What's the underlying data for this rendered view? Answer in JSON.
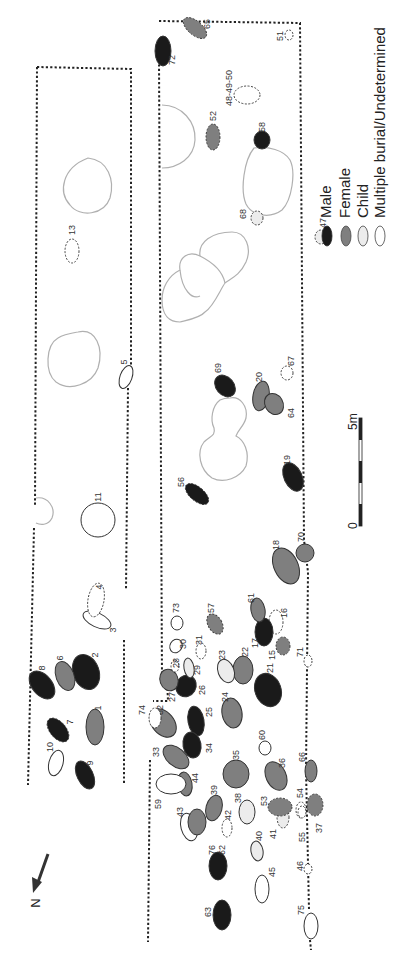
{
  "colors": {
    "male": "#1a1a1a",
    "female": "#7f7f7f",
    "child": "#ececec",
    "undetermined": "#ffffff",
    "stroke": "#333333",
    "pit_outline": "#b0b0b0",
    "trench_border": "#222222"
  },
  "legend": {
    "items": [
      {
        "key": "male",
        "label": "Male"
      },
      {
        "key": "female",
        "label": "Female"
      },
      {
        "key": "child",
        "label": "Child"
      },
      {
        "key": "undetermined",
        "label": "Multiple burial/Undetermined"
      }
    ]
  },
  "scale_bar": {
    "start_label": "0",
    "end_label": "5m"
  },
  "north_arrow": {
    "label": "N"
  },
  "burials": [
    {
      "id": "1",
      "label": "1",
      "category": "female",
      "cx": 95,
      "cy": 727,
      "rx": 9,
      "ry": 18,
      "rot": 0,
      "dashed": false,
      "lx": 98,
      "ly": 708
    },
    {
      "id": "2",
      "label": "2",
      "category": "male",
      "cx": 86,
      "cy": 672,
      "rx": 13,
      "ry": 18,
      "rot": -20,
      "dashed": false,
      "lx": 95,
      "ly": 655
    },
    {
      "id": "3",
      "label": "3",
      "category": "undetermined",
      "cx": 97,
      "cy": 620,
      "rx": 15,
      "ry": 7,
      "rot": 25,
      "dashed": false,
      "lx": 113,
      "ly": 630
    },
    {
      "id": "4",
      "label": "4",
      "category": "undetermined",
      "cx": 96,
      "cy": 600,
      "rx": 8,
      "ry": 17,
      "rot": 10,
      "dashed": true,
      "lx": 99,
      "ly": 587
    },
    {
      "id": "5",
      "label": "5",
      "category": "undetermined",
      "cx": 126,
      "cy": 377,
      "rx": 6,
      "ry": 12,
      "rot": 20,
      "dashed": false,
      "lx": 124,
      "ly": 362
    },
    {
      "id": "6",
      "label": "6",
      "category": "female",
      "cx": 65,
      "cy": 676,
      "rx": 9,
      "ry": 15,
      "rot": -20,
      "dashed": false,
      "lx": 60,
      "ly": 658
    },
    {
      "id": "7",
      "label": "7",
      "category": "male",
      "cx": 58,
      "cy": 730,
      "rx": 8,
      "ry": 14,
      "rot": -40,
      "dashed": true,
      "lx": 70,
      "ly": 722
    },
    {
      "id": "8",
      "label": "8",
      "category": "male",
      "cx": 42,
      "cy": 685,
      "rx": 10,
      "ry": 16,
      "rot": -40,
      "dashed": false,
      "lx": 42,
      "ly": 668
    },
    {
      "id": "9",
      "label": "9",
      "category": "male",
      "cx": 85,
      "cy": 775,
      "rx": 8,
      "ry": 15,
      "rot": -25,
      "dashed": false,
      "lx": 90,
      "ly": 763
    },
    {
      "id": "10",
      "label": "10",
      "category": "undetermined",
      "cx": 56,
      "cy": 763,
      "rx": 7,
      "ry": 13,
      "rot": 15,
      "dashed": false,
      "lx": 50,
      "ly": 747
    },
    {
      "id": "11",
      "label": "11",
      "category": "undetermined",
      "cx": 98,
      "cy": 520,
      "rx": 17,
      "ry": 17,
      "rot": 0,
      "dashed": false,
      "lx": 98,
      "ly": 497
    },
    {
      "id": "13",
      "label": "13",
      "category": "undetermined",
      "cx": 72,
      "cy": 251,
      "rx": 7,
      "ry": 12,
      "rot": 0,
      "dashed": true,
      "lx": 72,
      "ly": 230
    },
    {
      "id": "15",
      "label": "15",
      "category": "female",
      "cx": 283,
      "cy": 646,
      "rx": 7,
      "ry": 9,
      "rot": 0,
      "dashed": true,
      "lx": 272,
      "ly": 655
    },
    {
      "id": "16",
      "label": "16",
      "category": "undetermined",
      "cx": 276,
      "cy": 622,
      "rx": 7,
      "ry": 12,
      "rot": 0,
      "dashed": true,
      "lx": 284,
      "ly": 613
    },
    {
      "id": "17",
      "label": "17",
      "category": "male",
      "cx": 264,
      "cy": 632,
      "rx": 9,
      "ry": 14,
      "rot": 0,
      "dashed": false,
      "lx": 255,
      "ly": 643
    },
    {
      "id": "18",
      "label": "18",
      "category": "female",
      "cx": 286,
      "cy": 566,
      "rx": 12,
      "ry": 19,
      "rot": -25,
      "dashed": false,
      "lx": 276,
      "ly": 545
    },
    {
      "id": "19",
      "label": "19",
      "category": "male",
      "cx": 293,
      "cy": 477,
      "rx": 9,
      "ry": 15,
      "rot": -25,
      "dashed": false,
      "lx": 287,
      "ly": 460
    },
    {
      "id": "20",
      "label": "20",
      "category": "female",
      "cx": 261,
      "cy": 396,
      "rx": 8,
      "ry": 15,
      "rot": 10,
      "dashed": false,
      "lx": 259,
      "ly": 377
    },
    {
      "id": "21",
      "label": "21",
      "category": "male",
      "cx": 268,
      "cy": 690,
      "rx": 13,
      "ry": 17,
      "rot": -20,
      "dashed": false,
      "lx": 270,
      "ly": 668
    },
    {
      "id": "22",
      "label": "22",
      "category": "female",
      "cx": 243,
      "cy": 670,
      "rx": 10,
      "ry": 14,
      "rot": 0,
      "dashed": false,
      "lx": 245,
      "ly": 652
    },
    {
      "id": "23",
      "label": "23",
      "category": "child",
      "cx": 226,
      "cy": 671,
      "rx": 8,
      "ry": 12,
      "rot": -20,
      "dashed": false,
      "lx": 222,
      "ly": 655
    },
    {
      "id": "24",
      "label": "24",
      "category": "female",
      "cx": 232,
      "cy": 713,
      "rx": 10,
      "ry": 15,
      "rot": -10,
      "dashed": false,
      "lx": 225,
      "ly": 697
    },
    {
      "id": "25",
      "label": "25",
      "category": "male",
      "cx": 196,
      "cy": 721,
      "rx": 8,
      "ry": 15,
      "rot": -10,
      "dashed": false,
      "lx": 209,
      "ly": 712
    },
    {
      "id": "26",
      "label": "26",
      "category": "male",
      "cx": 186,
      "cy": 686,
      "rx": 10,
      "ry": 11,
      "rot": 30,
      "dashed": false,
      "lx": 202,
      "ly": 690
    },
    {
      "id": "27",
      "label": "27",
      "category": "female",
      "cx": 169,
      "cy": 680,
      "rx": 9,
      "ry": 11,
      "rot": -20,
      "dashed": false,
      "lx": 172,
      "ly": 697
    },
    {
      "id": "28",
      "label": "28",
      "category": "undetermined",
      "cx": 175,
      "cy": 666,
      "rx": 4,
      "ry": 6,
      "rot": 0,
      "dashed": true,
      "lx": 176,
      "ly": 663
    },
    {
      "id": "29",
      "label": "29",
      "category": "child",
      "cx": 189,
      "cy": 668,
      "rx": 5,
      "ry": 10,
      "rot": -10,
      "dashed": false,
      "lx": 197,
      "ly": 670
    },
    {
      "id": "30",
      "label": "30",
      "category": "undetermined",
      "cx": 176,
      "cy": 646,
      "rx": 6,
      "ry": 7,
      "rot": 30,
      "dashed": false,
      "lx": 183,
      "ly": 644
    },
    {
      "id": "31",
      "label": "31",
      "category": "undetermined",
      "cx": 201,
      "cy": 651,
      "rx": 5,
      "ry": 8,
      "rot": 0,
      "dashed": true,
      "lx": 199,
      "ly": 640
    },
    {
      "id": "32",
      "label": "32",
      "category": "female",
      "cx": 163,
      "cy": 723,
      "rx": 11,
      "ry": 16,
      "rot": -40,
      "dashed": false,
      "lx": 160,
      "ly": 710
    },
    {
      "id": "33",
      "label": "33",
      "category": "female",
      "cx": 176,
      "cy": 757,
      "rx": 9,
      "ry": 15,
      "rot": -50,
      "dashed": false,
      "lx": 156,
      "ly": 752
    },
    {
      "id": "34",
      "label": "34",
      "category": "male",
      "cx": 192,
      "cy": 745,
      "rx": 9,
      "ry": 13,
      "rot": -10,
      "dashed": false,
      "lx": 209,
      "ly": 748
    },
    {
      "id": "35",
      "label": "35",
      "category": "female",
      "cx": 236,
      "cy": 774,
      "rx": 13,
      "ry": 14,
      "rot": 0,
      "dashed": false,
      "lx": 236,
      "ly": 755
    },
    {
      "id": "36",
      "label": "36",
      "category": "female",
      "cx": 276,
      "cy": 776,
      "rx": 10,
      "ry": 15,
      "rot": -25,
      "dashed": false,
      "lx": 282,
      "ly": 763
    },
    {
      "id": "37",
      "label": "37",
      "category": "female",
      "cx": 315,
      "cy": 805,
      "rx": 8,
      "ry": 11,
      "rot": 0,
      "dashed": true,
      "lx": 319,
      "ly": 828
    },
    {
      "id": "38",
      "label": "38",
      "category": "child",
      "cx": 247,
      "cy": 812,
      "rx": 8,
      "ry": 12,
      "rot": 0,
      "dashed": false,
      "lx": 238,
      "ly": 798
    },
    {
      "id": "39",
      "label": "39",
      "category": "female",
      "cx": 214,
      "cy": 808,
      "rx": 8,
      "ry": 13,
      "rot": 15,
      "dashed": false,
      "lx": 214,
      "ly": 790
    },
    {
      "id": "40",
      "label": "40",
      "category": "child",
      "cx": 257,
      "cy": 851,
      "rx": 6,
      "ry": 10,
      "rot": -10,
      "dashed": false,
      "lx": 259,
      "ly": 836
    },
    {
      "id": "41",
      "label": "41",
      "category": "child",
      "cx": 283,
      "cy": 817,
      "rx": 6,
      "ry": 11,
      "rot": 0,
      "dashed": true,
      "lx": 273,
      "ly": 834
    },
    {
      "id": "42",
      "label": "42",
      "category": "undetermined",
      "cx": 227,
      "cy": 828,
      "rx": 5,
      "ry": 9,
      "rot": 0,
      "dashed": true,
      "lx": 228,
      "ly": 815
    },
    {
      "id": "43",
      "label": "43",
      "category": "undetermined",
      "cx": 189,
      "cy": 827,
      "rx": 8,
      "ry": 14,
      "rot": -15,
      "dashed": false,
      "lx": 180,
      "ly": 812
    },
    {
      "id": "44",
      "label": "44",
      "category": "female",
      "cx": 185,
      "cy": 784,
      "rx": 7,
      "ry": 12,
      "rot": -10,
      "dashed": false,
      "lx": 195,
      "ly": 778
    },
    {
      "id": "45",
      "label": "45",
      "category": "undetermined",
      "cx": 262,
      "cy": 889,
      "rx": 7,
      "ry": 14,
      "rot": 0,
      "dashed": false,
      "lx": 272,
      "ly": 872
    },
    {
      "id": "46",
      "label": "46",
      "category": "undetermined",
      "cx": 308,
      "cy": 869,
      "rx": 4,
      "ry": 5,
      "rot": 0,
      "dashed": true,
      "lx": 300,
      "ly": 866
    },
    {
      "id": "47",
      "label": "47",
      "category": "child",
      "cx": 321,
      "cy": 237,
      "rx": 6,
      "ry": 7,
      "rot": 0,
      "dashed": true,
      "lx": 323,
      "ly": 223
    },
    {
      "id": "48-49-50",
      "label": "48-49-50",
      "category": "undetermined",
      "cx": 247,
      "cy": 95,
      "rx": 13,
      "ry": 9,
      "rot": 0,
      "dashed": true,
      "lx": 229,
      "ly": 88
    },
    {
      "id": "51",
      "label": "51",
      "category": "undetermined",
      "cx": 289,
      "cy": 35,
      "rx": 4,
      "ry": 5,
      "rot": 0,
      "dashed": true,
      "lx": 280,
      "ly": 36
    },
    {
      "id": "52",
      "label": "52",
      "category": "female",
      "cx": 213,
      "cy": 137,
      "rx": 7,
      "ry": 13,
      "rot": 0,
      "dashed": true,
      "lx": 213,
      "ly": 116
    },
    {
      "id": "53",
      "label": "53",
      "category": "female",
      "cx": 280,
      "cy": 807,
      "rx": 12,
      "ry": 9,
      "rot": 0,
      "dashed": true,
      "lx": 264,
      "ly": 801
    },
    {
      "id": "54",
      "label": "54",
      "category": "undetermined",
      "cx": 301,
      "cy": 810,
      "rx": 5,
      "ry": 8,
      "rot": 0,
      "dashed": true,
      "lx": 300,
      "ly": 793
    },
    {
      "id": "55",
      "label": "55",
      "category": "undetermined",
      "cx": 302,
      "cy": 812,
      "rx": 4,
      "ry": 6,
      "rot": 0,
      "dashed": true,
      "lx": 302,
      "ly": 837
    },
    {
      "id": "56",
      "label": "56",
      "category": "male",
      "cx": 197,
      "cy": 494,
      "rx": 7,
      "ry": 14,
      "rot": -50,
      "dashed": true,
      "lx": 181,
      "ly": 482
    },
    {
      "id": "57",
      "label": "57",
      "category": "female",
      "cx": 215,
      "cy": 624,
      "rx": 7,
      "ry": 11,
      "rot": -30,
      "dashed": true,
      "lx": 211,
      "ly": 608
    },
    {
      "id": "58",
      "label": "58",
      "category": "male",
      "cx": 262,
      "cy": 140,
      "rx": 8,
      "ry": 9,
      "rot": 0,
      "dashed": false,
      "lx": 262,
      "ly": 127
    },
    {
      "id": "59",
      "label": "59",
      "category": "undetermined",
      "cx": 171,
      "cy": 784,
      "rx": 15,
      "ry": 10,
      "rot": 0,
      "dashed": false,
      "lx": 158,
      "ly": 804
    },
    {
      "id": "60",
      "label": "60",
      "category": "undetermined",
      "cx": 265,
      "cy": 748,
      "rx": 6,
      "ry": 7,
      "rot": 0,
      "dashed": false,
      "lx": 262,
      "ly": 735
    },
    {
      "id": "61",
      "label": "61",
      "category": "female",
      "cx": 258,
      "cy": 610,
      "rx": 7,
      "ry": 12,
      "rot": -10,
      "dashed": false,
      "lx": 251,
      "ly": 598
    },
    {
      "id": "62",
      "label": "62",
      "category": "male",
      "cx": 218,
      "cy": 866,
      "rx": 9,
      "ry": 14,
      "rot": 0,
      "dashed": false,
      "lx": 222,
      "ly": 850
    },
    {
      "id": "63",
      "label": "63",
      "category": "male",
      "cx": 222,
      "cy": 915,
      "rx": 9,
      "ry": 15,
      "rot": 0,
      "dashed": false,
      "lx": 208,
      "ly": 912
    },
    {
      "id": "64",
      "label": "64",
      "category": "female",
      "cx": 274,
      "cy": 404,
      "rx": 9,
      "ry": 11,
      "rot": -30,
      "dashed": false,
      "lx": 291,
      "ly": 413
    },
    {
      "id": "65",
      "label": "65",
      "category": "female",
      "cx": 195,
      "cy": 28,
      "rx": 7,
      "ry": 14,
      "rot": -50,
      "dashed": true,
      "lx": 207,
      "ly": 24
    },
    {
      "id": "66",
      "label": "66",
      "category": "female",
      "cx": 311,
      "cy": 771,
      "rx": 6,
      "ry": 11,
      "rot": 0,
      "dashed": false,
      "lx": 302,
      "ly": 757
    },
    {
      "id": "67",
      "label": "67",
      "category": "undetermined",
      "cx": 287,
      "cy": 373,
      "rx": 6,
      "ry": 7,
      "rot": 0,
      "dashed": true,
      "lx": 291,
      "ly": 361
    },
    {
      "id": "68",
      "label": "68",
      "category": "child",
      "cx": 257,
      "cy": 218,
      "rx": 6,
      "ry": 7,
      "rot": 0,
      "dashed": true,
      "lx": 243,
      "ly": 214
    },
    {
      "id": "69",
      "label": "69",
      "category": "male",
      "cx": 225,
      "cy": 386,
      "rx": 9,
      "ry": 12,
      "rot": -40,
      "dashed": false,
      "lx": 218,
      "ly": 368
    },
    {
      "id": "70",
      "label": "70",
      "category": "female",
      "cx": 305,
      "cy": 553,
      "rx": 9,
      "ry": 9,
      "rot": 0,
      "dashed": false,
      "lx": 301,
      "ly": 537
    },
    {
      "id": "71",
      "label": "71",
      "category": "undetermined",
      "cx": 308,
      "cy": 661,
      "rx": 4,
      "ry": 6,
      "rot": 0,
      "dashed": true,
      "lx": 300,
      "ly": 652
    },
    {
      "id": "72",
      "label": "72",
      "category": "male",
      "cx": 163,
      "cy": 51,
      "rx": 8,
      "ry": 15,
      "rot": 0,
      "dashed": false,
      "lx": 172,
      "ly": 60
    },
    {
      "id": "73",
      "label": "73",
      "category": "undetermined",
      "cx": 177,
      "cy": 623,
      "rx": 6,
      "ry": 7,
      "rot": 0,
      "dashed": false,
      "lx": 176,
      "ly": 608
    },
    {
      "id": "74",
      "label": "74",
      "category": "undetermined",
      "cx": 155,
      "cy": 718,
      "rx": 6,
      "ry": 10,
      "rot": 0,
      "dashed": true,
      "lx": 142,
      "ly": 710
    },
    {
      "id": "75",
      "label": "75",
      "category": "undetermined",
      "cx": 311,
      "cy": 926,
      "rx": 7,
      "ry": 13,
      "rot": 0,
      "dashed": false,
      "lx": 301,
      "ly": 910
    },
    {
      "id": "76",
      "label": "76",
      "category": "female",
      "cx": 197,
      "cy": 822,
      "rx": 9,
      "ry": 13,
      "rot": 0,
      "dashed": false,
      "lx": 212,
      "ly": 850
    }
  ],
  "pits": [
    {
      "id": "pit-west-1",
      "d": "M 88 158 C 108 160 115 180 110 198 C 104 215 80 218 70 205 C 58 192 62 168 88 158 Z"
    },
    {
      "id": "pit-west-2",
      "d": "M 78 332 C 96 328 104 348 98 368 C 92 384 70 392 56 382 C 44 372 46 345 58 338 C 64 334 72 333 78 332 Z"
    },
    {
      "id": "pit-west-3",
      "d": "M 36 498 C 48 496 56 508 52 518 C 48 526 40 525 36 523"
    },
    {
      "id": "pit-east-1",
      "d": "M 162 105 C 182 105 196 122 195 140 C 194 158 178 168 162 168"
    },
    {
      "id": "pit-east-58",
      "d": "M 254 148 C 268 146 284 150 290 160 C 296 172 292 200 282 210 C 270 219 252 216 246 204 C 240 190 244 160 254 148 Z"
    },
    {
      "id": "pit-east-chain",
      "d": "M 232 232 C 246 232 252 248 246 262 C 240 275 232 278 225 283 C 220 290 214 306 205 312 C 200 318 188 320 180 322 C 170 322 162 316 162 300 C 162 288 168 276 180 270 C 178 258 188 250 200 256 C 198 242 212 232 232 232 Z"
    },
    {
      "id": "pit-east-chain-2",
      "d": "M 180 270 C 182 290 192 300 200 296 M 200 256 C 208 260 222 268 225 283"
    },
    {
      "id": "pit-east-69",
      "d": "M 230 398 C 240 396 248 406 246 418 C 244 426 238 430 236 436 C 244 440 250 452 246 466 C 240 478 224 484 212 478 C 200 470 196 452 204 442 C 210 436 216 436 214 428 C 210 420 212 406 220 400 C 224 398 228 398 230 398 Z"
    }
  ]
}
